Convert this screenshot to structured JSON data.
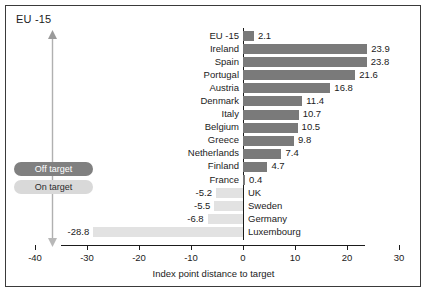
{
  "figure": {
    "title": "EU -15",
    "axis_title": "Index point distance to target"
  },
  "legend": {
    "off_target": "Off target",
    "on_target": "On target",
    "off_color": "#808080",
    "on_color": "#d9d9d9"
  },
  "axis": {
    "ticks": [
      -40,
      -30,
      -20,
      -10,
      0,
      10,
      20,
      30
    ],
    "tick_labels": [
      "-40",
      "-30",
      "-20",
      "-10",
      "0",
      "10",
      "20",
      "30"
    ]
  },
  "chart_data": {
    "type": "bar",
    "orientation": "horizontal",
    "title": "EU -15",
    "xlabel": "Index point distance to target",
    "ylabel": "",
    "xlim": [
      -40,
      30
    ],
    "grid": false,
    "legend_position": "left",
    "legend": [
      "Off target",
      "On target"
    ],
    "categories": [
      "EU -15",
      "Ireland",
      "Spain",
      "Portugal",
      "Austria",
      "Denmark",
      "Italy",
      "Belgium",
      "Greece",
      "Netherlands",
      "Finland",
      "France",
      "UK",
      "Sweden",
      "Germany",
      "Luxembourg"
    ],
    "values": [
      2.1,
      23.9,
      23.8,
      21.6,
      16.8,
      11.4,
      10.7,
      10.5,
      9.8,
      7.4,
      4.7,
      0.4,
      -5.2,
      -5.5,
      -6.8,
      -28.8
    ],
    "value_labels": [
      "2.1",
      "23.9",
      "23.8",
      "21.6",
      "16.8",
      "11.4",
      "10.7",
      "10.5",
      "9.8",
      "7.4",
      "4.7",
      "0.4",
      "-5.2",
      "-5.5",
      "-6.8",
      "-28.8"
    ],
    "series": [
      {
        "name": "Off target",
        "color": "#7a7a7a",
        "items": [
          {
            "category": "EU -15",
            "value": 2.1,
            "label": "2.1"
          },
          {
            "category": "Ireland",
            "value": 23.9,
            "label": "23.9"
          },
          {
            "category": "Spain",
            "value": 23.8,
            "label": "23.8"
          },
          {
            "category": "Portugal",
            "value": 21.6,
            "label": "21.6"
          },
          {
            "category": "Austria",
            "value": 16.8,
            "label": "16.8"
          },
          {
            "category": "Denmark",
            "value": 11.4,
            "label": "11.4"
          },
          {
            "category": "Italy",
            "value": 10.7,
            "label": "10.7"
          },
          {
            "category": "Belgium",
            "value": 10.5,
            "label": "10.5"
          },
          {
            "category": "Greece",
            "value": 9.8,
            "label": "9.8"
          },
          {
            "category": "Netherlands",
            "value": 7.4,
            "label": "7.4"
          },
          {
            "category": "Finland",
            "value": 4.7,
            "label": "4.7"
          },
          {
            "category": "France",
            "value": 0.4,
            "label": "0.4"
          }
        ]
      },
      {
        "name": "On target",
        "color": "#e2e2e2",
        "items": [
          {
            "category": "UK",
            "value": -5.2,
            "label": "-5.2"
          },
          {
            "category": "Sweden",
            "value": -5.5,
            "label": "-5.5"
          },
          {
            "category": "Germany",
            "value": -6.8,
            "label": "-6.8"
          },
          {
            "category": "Luxembourg",
            "value": -28.8,
            "label": "-28.8"
          }
        ]
      }
    ]
  }
}
